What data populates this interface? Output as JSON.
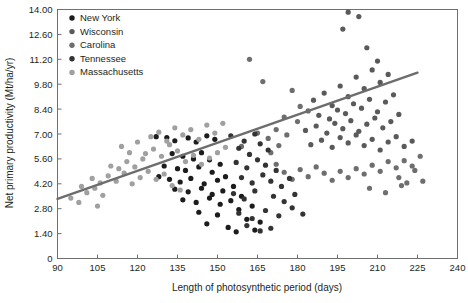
{
  "chart_data": {
    "type": "scatter",
    "title": "",
    "xlabel": "Length of photosynthetic period (days)",
    "ylabel": "Net primary productivity (Mt/ha/yr)",
    "xlim": [
      90,
      240
    ],
    "ylim": [
      0,
      14.0
    ],
    "xticks": [
      90,
      105,
      120,
      135,
      150,
      165,
      180,
      195,
      210,
      225,
      240
    ],
    "xtick_labels": [
      "90",
      "105",
      "120",
      "135",
      "150",
      "165",
      "180",
      "195",
      "210",
      "225",
      "240"
    ],
    "yticks": [
      0,
      1.4,
      2.8,
      4.2,
      5.6,
      7.0,
      8.4,
      9.8,
      11.2,
      12.6,
      14.0
    ],
    "ytick_labels": [
      "0",
      "1.40",
      "2.80",
      "4.20",
      "5.60",
      "7.00",
      "8.40",
      "9.80",
      "11.20",
      "12.60",
      "14.00"
    ],
    "grid": false,
    "legend_position": "top-left-inside",
    "trend_line": {
      "label": "linear fit",
      "color": "#6d6d6d",
      "x_start": 90,
      "y_start": 3.35,
      "x_end": 225,
      "y_end": 10.45
    },
    "series": [
      {
        "name": "New York",
        "color": "#1c1c1c",
        "points": [
          [
            127,
            6.85
          ],
          [
            131,
            6.8
          ],
          [
            134,
            6.62
          ],
          [
            139,
            6.78
          ],
          [
            142,
            6.55
          ],
          [
            146,
            6.9
          ],
          [
            149,
            6.7
          ],
          [
            133,
            5.9
          ],
          [
            137,
            5.75
          ],
          [
            141,
            5.6
          ],
          [
            144,
            5.95
          ],
          [
            147,
            5.55
          ],
          [
            130,
            5.2
          ],
          [
            135,
            5.05
          ],
          [
            138,
            4.95
          ],
          [
            143,
            5.15
          ],
          [
            148,
            4.85
          ],
          [
            151,
            5.3
          ],
          [
            128,
            4.6
          ],
          [
            132,
            4.45
          ],
          [
            136,
            4.3
          ],
          [
            140,
            4.5
          ],
          [
            145,
            4.2
          ],
          [
            150,
            4.4
          ],
          [
            153,
            4.6
          ],
          [
            134,
            3.9
          ],
          [
            139,
            3.75
          ],
          [
            144,
            3.95
          ],
          [
            148,
            3.6
          ],
          [
            152,
            3.8
          ],
          [
            156,
            4.05
          ],
          [
            137,
            3.3
          ],
          [
            142,
            3.15
          ],
          [
            147,
            3.4
          ],
          [
            151,
            3.05
          ],
          [
            155,
            3.25
          ],
          [
            159,
            3.5
          ],
          [
            143,
            2.6
          ],
          [
            150,
            2.45
          ],
          [
            158,
            2.75
          ],
          [
            163,
            2.95
          ],
          [
            146,
            1.95
          ],
          [
            154,
            1.75
          ],
          [
            161,
            2.2
          ],
          [
            166,
            2.05
          ],
          [
            157,
            1.5
          ],
          [
            164,
            1.6
          ]
        ]
      },
      {
        "name": "Wisconsin",
        "color": "#5a5a5a",
        "points": [
          [
            186,
            8.9
          ],
          [
            190,
            9.3
          ],
          [
            193,
            8.6
          ],
          [
            196,
            9.7
          ],
          [
            199,
            9.1
          ],
          [
            202,
            10.2
          ],
          [
            205,
            9.55
          ],
          [
            208,
            10.6
          ],
          [
            211,
            9.9
          ],
          [
            214,
            10.35
          ],
          [
            188,
            8.05
          ],
          [
            192,
            7.85
          ],
          [
            195,
            8.35
          ],
          [
            198,
            8.15
          ],
          [
            201,
            8.7
          ],
          [
            204,
            8.45
          ],
          [
            207,
            8.95
          ],
          [
            210,
            8.25
          ],
          [
            213,
            8.8
          ],
          [
            216,
            9.2
          ],
          [
            183,
            7.2
          ],
          [
            187,
            7.45
          ],
          [
            191,
            7.05
          ],
          [
            194,
            7.6
          ],
          [
            197,
            7.3
          ],
          [
            200,
            7.75
          ],
          [
            203,
            7.15
          ],
          [
            206,
            7.55
          ],
          [
            209,
            7.9
          ],
          [
            212,
            7.35
          ],
          [
            215,
            7.7
          ],
          [
            218,
            8.1
          ],
          [
            185,
            6.4
          ],
          [
            189,
            6.65
          ],
          [
            193,
            6.25
          ],
          [
            196,
            6.8
          ],
          [
            199,
            6.5
          ],
          [
            202,
            6.95
          ],
          [
            205,
            6.35
          ],
          [
            208,
            6.7
          ],
          [
            211,
            6.1
          ],
          [
            214,
            6.55
          ],
          [
            217,
            6.85
          ],
          [
            220,
            6.3
          ],
          [
            223,
            6.6
          ],
          [
            197,
            12.9
          ],
          [
            203,
            13.6
          ],
          [
            206,
            11.85
          ],
          [
            199,
            13.85
          ],
          [
            210,
            11.1
          ]
        ]
      },
      {
        "name": "Carolina",
        "color": "#6e6e6e",
        "points": [
          [
            178,
            9.45
          ],
          [
            181,
            8.55
          ],
          [
            175,
            7.95
          ],
          [
            172,
            7.25
          ],
          [
            169,
            6.75
          ],
          [
            180,
            7.7
          ],
          [
            184,
            8.3
          ],
          [
            176,
            6.95
          ],
          [
            173,
            6.35
          ],
          [
            170,
            5.95
          ],
          [
            220,
            5.5
          ],
          [
            223,
            5.2
          ],
          [
            226,
            5.75
          ],
          [
            217,
            5.1
          ],
          [
            214,
            5.45
          ],
          [
            211,
            4.9
          ],
          [
            208,
            5.25
          ],
          [
            205,
            4.75
          ],
          [
            202,
            5.05
          ],
          [
            199,
            4.55
          ],
          [
            196,
            4.9
          ],
          [
            193,
            4.4
          ],
          [
            190,
            4.8
          ],
          [
            187,
            5.15
          ],
          [
            184,
            4.6
          ],
          [
            181,
            5.0
          ],
          [
            178,
            4.45
          ],
          [
            175,
            4.85
          ],
          [
            172,
            5.3
          ],
          [
            221,
            4.25
          ],
          [
            218,
            4.55
          ],
          [
            224,
            4.95
          ],
          [
            227,
            4.35
          ],
          [
            207,
            3.95
          ],
          [
            213,
            3.7
          ],
          [
            219,
            4.1
          ],
          [
            162,
            11.2
          ],
          [
            167,
            9.95
          ],
          [
            159,
            6.3
          ],
          [
            165,
            7.05
          ]
        ]
      },
      {
        "name": "Tennessee",
        "color": "#333333",
        "points": [
          [
            155,
            6.9
          ],
          [
            160,
            6.6
          ],
          [
            164,
            7.0
          ],
          [
            158,
            6.2
          ],
          [
            162,
            5.85
          ],
          [
            166,
            6.45
          ],
          [
            169,
            6.1
          ],
          [
            157,
            5.4
          ],
          [
            161,
            5.1
          ],
          [
            165,
            5.55
          ],
          [
            168,
            5.25
          ],
          [
            172,
            4.95
          ],
          [
            159,
            4.55
          ],
          [
            163,
            4.25
          ],
          [
            167,
            4.7
          ],
          [
            170,
            4.35
          ],
          [
            174,
            4.05
          ],
          [
            177,
            4.5
          ],
          [
            156,
            3.65
          ],
          [
            160,
            3.35
          ],
          [
            164,
            3.8
          ],
          [
            171,
            3.5
          ],
          [
            175,
            3.2
          ],
          [
            179,
            3.6
          ],
          [
            158,
            2.55
          ],
          [
            163,
            2.25
          ],
          [
            168,
            2.7
          ],
          [
            173,
            2.4
          ],
          [
            178,
            2.85
          ],
          [
            182,
            2.5
          ],
          [
            161,
            1.85
          ],
          [
            166,
            1.55
          ],
          [
            170,
            1.7
          ]
        ]
      },
      {
        "name": "Massachusetts",
        "color": "#a0a0a0",
        "points": [
          [
            95,
            3.4
          ],
          [
            98,
            3.15
          ],
          [
            101,
            3.7
          ],
          [
            104,
            3.95
          ],
          [
            107,
            3.55
          ],
          [
            103,
            4.5
          ],
          [
            106,
            4.25
          ],
          [
            109,
            4.65
          ],
          [
            112,
            4.35
          ],
          [
            115,
            4.8
          ],
          [
            110,
            5.2
          ],
          [
            113,
            5.05
          ],
          [
            116,
            5.45
          ],
          [
            119,
            5.15
          ],
          [
            122,
            5.6
          ],
          [
            118,
            4.2
          ],
          [
            121,
            4.55
          ],
          [
            124,
            4.9
          ],
          [
            127,
            4.45
          ],
          [
            130,
            4.75
          ],
          [
            123,
            5.9
          ],
          [
            126,
            6.15
          ],
          [
            129,
            5.75
          ],
          [
            132,
            6.4
          ],
          [
            135,
            6.05
          ],
          [
            125,
            6.85
          ],
          [
            128,
            7.1
          ],
          [
            131,
            6.6
          ],
          [
            134,
            7.35
          ],
          [
            137,
            6.95
          ],
          [
            140,
            7.25
          ],
          [
            143,
            6.7
          ],
          [
            146,
            7.5
          ],
          [
            149,
            7.05
          ],
          [
            152,
            7.6
          ],
          [
            114,
            6.3
          ],
          [
            117,
            5.95
          ],
          [
            120,
            6.55
          ],
          [
            138,
            5.45
          ],
          [
            141,
            5.8
          ],
          [
            144,
            5.3
          ],
          [
            147,
            5.65
          ],
          [
            150,
            5.95
          ],
          [
            153,
            6.25
          ],
          [
            105,
            2.95
          ],
          [
            99,
            4.05
          ],
          [
            133,
            4.1
          ],
          [
            136,
            3.85
          ]
        ]
      }
    ]
  },
  "legend": {
    "items": [
      {
        "label": "New York",
        "color": "#1c1c1c"
      },
      {
        "label": "Wisconsin",
        "color": "#5a5a5a"
      },
      {
        "label": "Carolina",
        "color": "#6e6e6e"
      },
      {
        "label": "Tennessee",
        "color": "#333333"
      },
      {
        "label": "Massachusetts",
        "color": "#a0a0a0"
      }
    ]
  }
}
